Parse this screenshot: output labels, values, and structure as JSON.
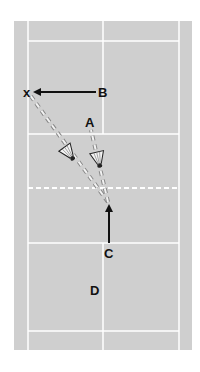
{
  "diagram": {
    "type": "badminton-court-drill",
    "colors": {
      "background": "#ffffff",
      "court": "#cfcfcf",
      "lines": "#ffffff",
      "arrow": "#111111",
      "label": "#111111",
      "shuttle_path": "#f2f2f2"
    },
    "labels": {
      "x_marker": "x",
      "a": "A",
      "b": "B",
      "c": "C",
      "d": "D"
    },
    "net": {
      "style": "dashed",
      "y": 188
    },
    "movements": [
      {
        "from": "B",
        "to": "x",
        "type": "solid-arrow"
      },
      {
        "from": "C-start",
        "to": "net",
        "type": "solid-arrow"
      }
    ],
    "shuttle_paths": [
      {
        "from": "net",
        "to": "x",
        "type": "dashed",
        "has_shuttle": true
      },
      {
        "from": "net",
        "to": "A",
        "type": "dashed",
        "has_shuttle": true
      }
    ]
  }
}
